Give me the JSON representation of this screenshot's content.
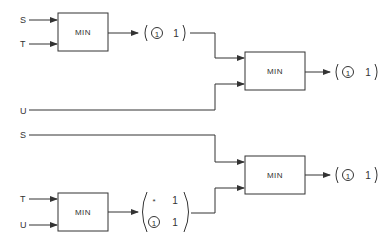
{
  "diagram": {
    "type": "block-diagram",
    "inputs": {
      "top_s": "S",
      "top_t": "T",
      "mid_u": "U",
      "bottom_s": "S",
      "bottom_t": "T",
      "bottom_u": "U"
    },
    "boxes": {
      "box1": "MIN",
      "box2": "MIN",
      "box3": "MIN",
      "box4": "MIN"
    },
    "vectors": {
      "v1": {
        "circled": "1",
        "value": "1"
      },
      "v2": {
        "circled": "1",
        "value": "1"
      },
      "v3": {
        "row1_marker": "*",
        "row1_value": "1",
        "row2_circled": "1",
        "row2_value": "1"
      },
      "v4": {
        "circled": "1",
        "value": "1"
      }
    }
  }
}
